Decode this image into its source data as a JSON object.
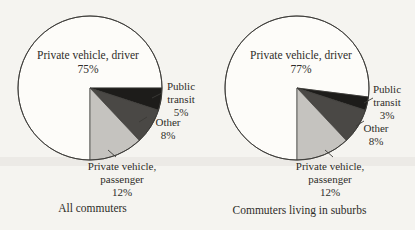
{
  "palette": {
    "paper": "#f5f4f0",
    "band": "#eceae6",
    "ink": "#2f2d29",
    "outline": "#3b3a37"
  },
  "chart_data": [
    {
      "type": "pie",
      "title": "All commuters",
      "start_angle_deg": 90,
      "direction": "clockwise",
      "labels_layout": "callout",
      "slices": [
        {
          "label": "Private vehicle, driver",
          "value": 75,
          "value_label": "75%",
          "color": "#fdfcf9"
        },
        {
          "label": "Public transit",
          "value": 5,
          "value_label": "5%",
          "color": "#1d1c1a"
        },
        {
          "label": "Other",
          "value": 8,
          "value_label": "8%",
          "color": "#4a4845"
        },
        {
          "label": "Private vehicle, passenger",
          "value": 12,
          "value_label": "12%",
          "color": "#c5c3bf"
        }
      ]
    },
    {
      "type": "pie",
      "title": "Commuters living in suburbs",
      "start_angle_deg": 90,
      "direction": "clockwise",
      "labels_layout": "callout",
      "slices": [
        {
          "label": "Private vehicle, driver",
          "value": 77,
          "value_label": "77%",
          "color": "#fdfcf9"
        },
        {
          "label": "Public transit",
          "value": 3,
          "value_label": "3%",
          "color": "#1d1c1a"
        },
        {
          "label": "Other",
          "value": 8,
          "value_label": "8%",
          "color": "#4a4845"
        },
        {
          "label": "Private vehicle, passenger",
          "value": 12,
          "value_label": "12%",
          "color": "#c5c3bf"
        }
      ]
    }
  ]
}
